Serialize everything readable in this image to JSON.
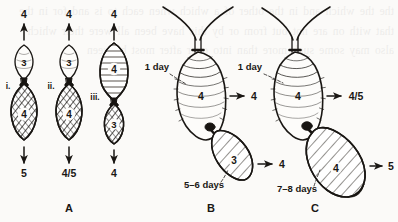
{
  "figure": {
    "caption_letters": [
      "A",
      "B",
      "C"
    ],
    "background_color": "#fbfaf8",
    "ink_color": "#1a1714"
  },
  "panel_a": {
    "letter": "A",
    "pairs": [
      {
        "roman_label": "i.",
        "top_arrow_label": "4",
        "upper_body_label": "3",
        "upper_body_shading": "plain",
        "lower_body_label": "4",
        "lower_body_shading": "hatched",
        "bottom_arrow_label": "5"
      },
      {
        "roman_label": "ii.",
        "top_arrow_label": "4",
        "upper_body_label": "3",
        "upper_body_shading": "plain",
        "lower_body_label": "4",
        "lower_body_shading": "hatched",
        "bottom_arrow_label": "4/5"
      },
      {
        "roman_label": "iii.",
        "top_arrow_label": "4",
        "upper_body_label": "4",
        "upper_body_shading": "striped",
        "lower_body_label": "3",
        "lower_body_shading": "hatched",
        "bottom_arrow_label": "4"
      }
    ]
  },
  "panel_b": {
    "letter": "B",
    "main_body_label": "4",
    "main_body_time_label": "1 day",
    "main_body_arrow_label": "4",
    "bud_body_label": "3",
    "bud_body_time_label": "5–6 days",
    "bud_body_arrow_label": "4",
    "arrow_glyph": "→"
  },
  "panel_c": {
    "letter": "C",
    "main_body_label": "4",
    "main_body_time_label": "1 day",
    "main_body_arrow_label": "4/5",
    "bud_body_label": "4",
    "bud_body_time_label": "7–8 days",
    "bud_body_arrow_label": "5",
    "arrow_glyph": "→"
  },
  "bleed_text": "the the which and in the other of a which when each to is and for in the that with on are not but from or by this have been all were their which also may some such more than into over after most between"
}
